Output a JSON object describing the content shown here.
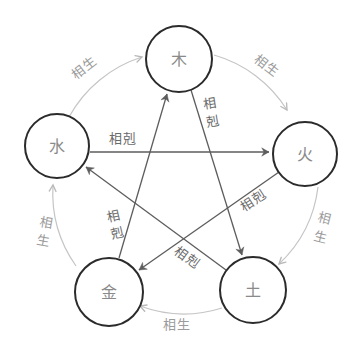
{
  "diagram": {
    "name": "wu-xing-five-elements-cycle",
    "elements": [
      {
        "id": "wood",
        "label": "木"
      },
      {
        "id": "fire",
        "label": "火"
      },
      {
        "id": "earth",
        "label": "土"
      },
      {
        "id": "metal",
        "label": "金"
      },
      {
        "id": "water",
        "label": "水"
      }
    ],
    "labels": {
      "generating": "相生",
      "overcoming": "相剋",
      "generating_chars": [
        "相",
        "生"
      ],
      "overcoming_chars": [
        "相",
        "剋"
      ]
    },
    "cycles": {
      "generating": [
        "水→木",
        "木→火",
        "火→土",
        "土→金",
        "金→水"
      ],
      "overcoming": [
        "水→火",
        "木→土",
        "火→金",
        "土→水",
        "金→木"
      ]
    },
    "colors": {
      "background": "#ffffff",
      "generating_line": "#c5c5c5",
      "generating_text": "#9b9b9b",
      "overcoming_line": "#5d5d5d",
      "overcoming_text": "#6a6a6a",
      "circle_stroke": "#2b2b2b",
      "element_text": "#8a8a8a"
    }
  }
}
